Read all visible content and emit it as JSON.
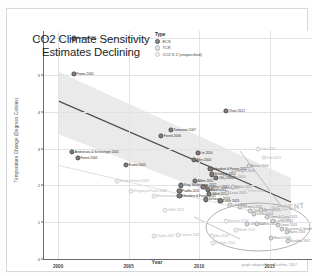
{
  "chart_data": {
    "type": "scatter",
    "title": "CO2 Climate Sensitivity Estimates Declining",
    "xlabel": "Year",
    "ylabel": "Temperature Change (Degrees Celsius)",
    "xlim": [
      1999,
      2018
    ],
    "ylim": [
      0,
      6.2
    ],
    "xticks": [
      "2000",
      "2005",
      "2010",
      "2015"
    ],
    "xtick_values": [
      2000,
      2005,
      2010,
      2015
    ],
    "yticks": [
      "0",
      "1",
      "2",
      "3",
      "4",
      "5",
      "6"
    ],
    "ytick_values": [
      0,
      1,
      2,
      3,
      4,
      5,
      6
    ],
    "grid": true,
    "legend_position": "top-center",
    "legend_title": "Type",
    "legend": [
      {
        "key": "ecs",
        "label": "ECS"
      },
      {
        "key": "tcr",
        "label": "TCR"
      },
      {
        "key": "co2",
        "label": "CO2 X 2 (unspecified)"
      }
    ],
    "trendline": {
      "x0": 2000,
      "y0": 4.3,
      "x1": 2016.5,
      "y1": 1.55
    },
    "confidence_band": {
      "upper": [
        {
          "x": 2000,
          "y": 5.1
        },
        {
          "x": 2016.5,
          "y": 2.2
        }
      ],
      "lower": [
        {
          "x": 2000,
          "y": 3.4
        },
        {
          "x": 2016.5,
          "y": 0.95
        }
      ]
    },
    "annotations": [
      {
        "text": "RECENT",
        "x": 2015.1,
        "y": 1.52
      },
      {
        "text": "graph adapted from Scafetta, 2017",
        "x": 2016,
        "y": -0.7
      }
    ],
    "points": [
      {
        "label": "Gregory 2002",
        "x": 2001.1,
        "y": 6.0,
        "type": "ecs",
        "side": "right"
      },
      {
        "label": "Frame 2005",
        "x": 2001.1,
        "y": 5.03,
        "type": "ecs",
        "side": "right"
      },
      {
        "label": "Olson 2012",
        "x": 2011.9,
        "y": 4.02,
        "type": "ecs",
        "side": "right"
      },
      {
        "label": "Tomassini 2007",
        "x": 2008.0,
        "y": 3.5,
        "type": "ecs",
        "side": "right"
      },
      {
        "label": "Forest 2006",
        "x": 2007.3,
        "y": 3.34,
        "type": "ecs",
        "side": "right"
      },
      {
        "label": "Andronova & Schlesinger 2001",
        "x": 2001.0,
        "y": 2.92,
        "type": "ecs",
        "side": "right"
      },
      {
        "label": "Forest 2002",
        "x": 2001.4,
        "y": 2.74,
        "type": "ecs",
        "side": "right"
      },
      {
        "label": "Frame 2005",
        "x": 2004.8,
        "y": 2.56,
        "type": "ecs",
        "side": "right"
      },
      {
        "label": "Lin 2010",
        "x": 2009.9,
        "y": 2.88,
        "type": "ecs",
        "side": "right"
      },
      {
        "label": "Allen 2000",
        "x": 2009.6,
        "y": 2.7,
        "type": "ecs",
        "side": "right"
      },
      {
        "label": "Otto 2013",
        "x": 2014.6,
        "y": 2.76,
        "type": "co2",
        "side": "right"
      },
      {
        "label": "Knutti & Forest 2005",
        "x": 2004.2,
        "y": 2.12,
        "type": "co2",
        "side": "right"
      },
      {
        "label": "Gregory & Forest 2008",
        "x": 2005.2,
        "y": 1.84,
        "type": "co2",
        "side": "right"
      },
      {
        "label": "Meinshausen 2009",
        "x": 2006.8,
        "y": 1.72,
        "type": "co2",
        "side": "right"
      },
      {
        "label": "Libardoni & Forest 2011",
        "x": 2010.8,
        "y": 2.44,
        "type": "ecs",
        "side": "right"
      },
      {
        "label": "Schwartz 2012",
        "x": 2010.9,
        "y": 2.3,
        "type": "ecs",
        "side": "right"
      },
      {
        "label": "Olson 2012",
        "x": 2011.2,
        "y": 2.2,
        "type": "ecs",
        "side": "right"
      },
      {
        "label": "Aldrin 2012",
        "x": 2009.7,
        "y": 2.12,
        "type": "ecs",
        "side": "right"
      },
      {
        "label": "Bender 2010",
        "x": 2011.8,
        "y": 2.22,
        "type": "tcr",
        "side": "right"
      },
      {
        "label": "Hegerl 2006",
        "x": 2012.5,
        "y": 2.4,
        "type": "tcr",
        "side": "right"
      },
      {
        "label": "Annan 2006",
        "x": 2013.5,
        "y": 2.52,
        "type": "tcr",
        "side": "right"
      },
      {
        "label": "Ring, Schlesinger 2012",
        "x": 2008.7,
        "y": 2.0,
        "type": "ecs",
        "side": "right"
      },
      {
        "label": "Padilla 2011",
        "x": 2008.6,
        "y": 1.86,
        "type": "ecs",
        "side": "right"
      },
      {
        "label": "Libardoni & Forest 2011",
        "x": 2008.6,
        "y": 1.72,
        "type": "ecs",
        "side": "right"
      },
      {
        "label": "Bengtsson 2012",
        "x": 2010.3,
        "y": 1.96,
        "type": "ecs",
        "side": "right"
      },
      {
        "label": "Aldrin 2012",
        "x": 2010.6,
        "y": 1.88,
        "type": "ecs",
        "side": "right"
      },
      {
        "label": "Gillett 2012",
        "x": 2010.7,
        "y": 1.78,
        "type": "ecs",
        "side": "right"
      },
      {
        "label": "Olson 2012",
        "x": 2011.5,
        "y": 1.92,
        "type": "tcr",
        "side": "right"
      },
      {
        "label": "Harris 2013",
        "x": 2012.4,
        "y": 1.96,
        "type": "tcr",
        "side": "right"
      },
      {
        "label": "Lewis 2013",
        "x": 2012.0,
        "y": 1.8,
        "type": "tcr",
        "side": "right"
      },
      {
        "label": "Otto 2013",
        "x": 2013.4,
        "y": 1.86,
        "type": "co2",
        "side": "right"
      },
      {
        "label": "Schwartz 2012",
        "x": 2010.5,
        "y": 1.62,
        "type": "ecs",
        "side": "right"
      },
      {
        "label": "Lewis 2013",
        "x": 2011.5,
        "y": 1.58,
        "type": "ecs",
        "side": "right"
      },
      {
        "label": "Otto 2013",
        "x": 2012.2,
        "y": 1.46,
        "type": "tcr",
        "side": "right"
      },
      {
        "label": "Masters 2013",
        "x": 2012.9,
        "y": 1.42,
        "type": "tcr",
        "side": "right"
      },
      {
        "label": "Otto 2013",
        "x": 2013.6,
        "y": 1.3,
        "type": "tcr",
        "side": "right"
      },
      {
        "label": "Lewis 2014",
        "x": 2013.9,
        "y": 1.22,
        "type": "tcr",
        "side": "right"
      },
      {
        "label": "Skeie 2014",
        "x": 2014.4,
        "y": 1.34,
        "type": "tcr",
        "side": "right"
      },
      {
        "label": "Lewis & Curry 2015",
        "x": 2014.8,
        "y": 1.14,
        "type": "tcr",
        "side": "right"
      },
      {
        "label": "Loehle 2014",
        "x": 2015.2,
        "y": 1.02,
        "type": "tcr",
        "side": "right"
      },
      {
        "label": "Lewis 2016",
        "x": 2015.6,
        "y": 0.92,
        "type": "tcr",
        "side": "right"
      },
      {
        "label": "Mauritsen & Stevens 2015",
        "x": 2015.9,
        "y": 0.82,
        "type": "tcr",
        "side": "right"
      },
      {
        "label": "Bates 2016",
        "x": 2016.2,
        "y": 0.74,
        "type": "tcr",
        "side": "right"
      },
      {
        "label": "Hirsch 2016",
        "x": 2015.1,
        "y": 0.56,
        "type": "tcr",
        "side": "right"
      },
      {
        "label": "Scafetta 2017",
        "x": 2016.3,
        "y": 0.5,
        "type": "tcr",
        "side": "right"
      },
      {
        "label": "Ollila 2014",
        "x": 2013.4,
        "y": 0.96,
        "type": "tcr",
        "side": "right"
      },
      {
        "label": "Loehle 2015",
        "x": 2014.1,
        "y": 0.94,
        "type": "tcr",
        "side": "right"
      },
      {
        "label": "Spencer 2014",
        "x": 2011.9,
        "y": 1.02,
        "type": "co2",
        "side": "right"
      },
      {
        "label": "Lindzen 2011",
        "x": 2008.5,
        "y": 0.66,
        "type": "co2",
        "side": "right"
      },
      {
        "label": "Idso 2008",
        "x": 2010.9,
        "y": 0.62,
        "type": "co2",
        "side": "right"
      },
      {
        "label": "Harde 2014",
        "x": 2012.6,
        "y": 0.78,
        "type": "co2",
        "side": "right"
      },
      {
        "label": "Chylek 2007",
        "x": 2006.8,
        "y": 0.62,
        "type": "co2",
        "side": "right"
      },
      {
        "label": "Lindzen 2014",
        "x": 2011.0,
        "y": 0.44,
        "type": "co2",
        "side": "right"
      },
      {
        "label": "Gillett 2012",
        "x": 2007.6,
        "y": 1.32,
        "type": "co2",
        "side": "right"
      },
      {
        "label": "Otto 2013",
        "x": 2014.2,
        "y": 2.98,
        "type": "co2",
        "side": "right"
      }
    ]
  }
}
